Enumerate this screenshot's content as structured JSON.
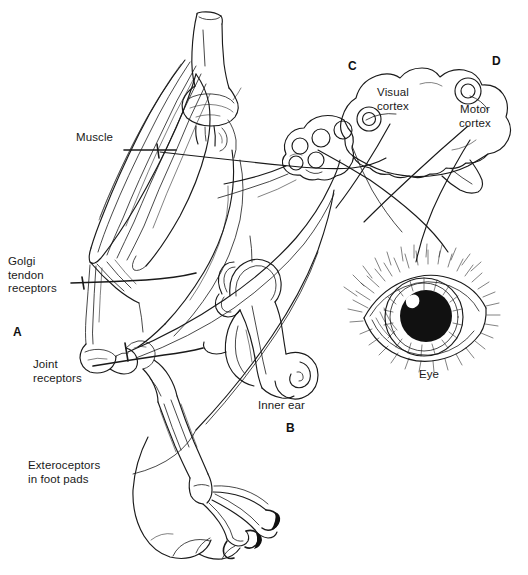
{
  "figure": {
    "style": "black and white pen-and-ink line drawing",
    "background_color": "#ffffff",
    "ink_color": "#1a1a1a"
  },
  "labels": {
    "muscle": "Muscle",
    "golgi_tendon_receptors": "Golgi\ntendon\nreceptors",
    "joint_receptors": "Joint\nreceptors",
    "exteroceptors": "Exteroceptors\nin foot pads",
    "inner_ear": "Inner ear",
    "eye": "Eye",
    "visual_cortex": "Visual\ncortex",
    "motor_cortex": "Motor\ncortex"
  },
  "panels": {
    "a": "A",
    "b": "B",
    "c": "C",
    "d": "D"
  },
  "panel_contents": {
    "a": "hind limb with muscle, bones, joint and foot pads",
    "b": "inner ear labyrinth with semicircular canals and cochlea",
    "c": "brain with cerebellum and visual cortex",
    "d": "brain with motor cortex"
  }
}
